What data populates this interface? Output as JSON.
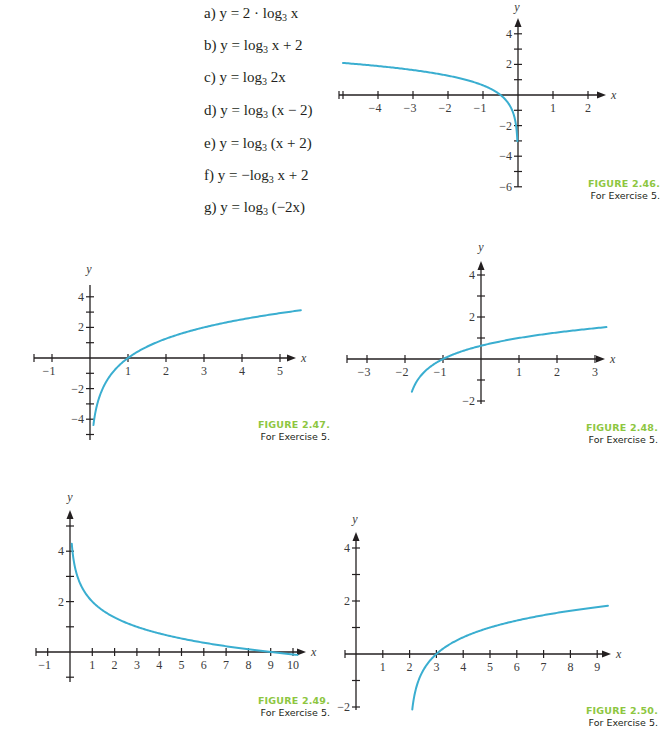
{
  "exercise": {
    "items": [
      {
        "label": "a)",
        "pre": "y = 2 · log",
        "base": "3",
        "post": " x"
      },
      {
        "label": "b)",
        "pre": "y = log",
        "base": "3",
        "post": " x + 2"
      },
      {
        "label": "c)",
        "pre": "y = log",
        "base": "3",
        "post": " 2x"
      },
      {
        "label": "d)",
        "pre": "y = log",
        "base": "3",
        "post": " (x − 2)"
      },
      {
        "label": "e)",
        "pre": "y = log",
        "base": "3",
        "post": " (x + 2)"
      },
      {
        "label": "f)",
        "pre": "y = −log",
        "base": "3",
        "post": " x + 2"
      },
      {
        "label": "g)",
        "pre": "y = log",
        "base": "3",
        "post": " (−2x)"
      }
    ]
  },
  "colors": {
    "curve": "#3aaed0",
    "axis": "#231f20",
    "caption_accent": "#8dc63f"
  },
  "chart_data": [
    {
      "id": "fig-2-46",
      "type": "line",
      "title": "FIGURE 2.46.",
      "subtitle": "For Exercise 5.",
      "xlabel": "x",
      "ylabel": "y",
      "xlim": [
        -5.1,
        2.5
      ],
      "ylim": [
        -6.3,
        5
      ],
      "x_ticks": [
        -4,
        -3,
        -2,
        -1,
        1,
        2
      ],
      "x_minor_ticks": [
        -5,
        -4,
        -3,
        -2,
        -1,
        1,
        2
      ],
      "y_ticks": [
        4,
        2,
        -2,
        -4,
        -6
      ],
      "y_minor_ticks": [
        4,
        3,
        2,
        1,
        -1,
        -2,
        -3,
        -4,
        -5,
        -6
      ],
      "grid": false,
      "function": "log3(-2x)",
      "k": -2,
      "h": 0,
      "a": 1,
      "c": 0,
      "domain": [
        -5.0,
        -0.018
      ],
      "points": [
        [
          -5,
          2.1
        ],
        [
          -3,
          1.63
        ],
        [
          -1,
          0.63
        ],
        [
          -0.5,
          0
        ],
        [
          -0.1,
          -1.46
        ],
        [
          -0.02,
          -2.93
        ]
      ],
      "layout": {
        "ox": 518,
        "oy": 95,
        "sx": 35,
        "sy": 15.3,
        "x_start": 339,
        "x_end": 606,
        "y_top": 18,
        "y_bottom": 187,
        "y_arrow": true,
        "ylabel_pos": [
          517,
          11
        ],
        "caption_pos": [
          568,
          178
        ]
      }
    },
    {
      "id": "fig-2-47",
      "type": "line",
      "title": "FIGURE 2.47.",
      "subtitle": "For Exercise 5.",
      "xlabel": "x",
      "ylabel": "y",
      "xlim": [
        -1.3,
        5.6
      ],
      "ylim": [
        -5.2,
        4.7
      ],
      "x_ticks": [
        -1,
        1,
        2,
        3,
        4,
        5
      ],
      "x_minor_ticks": [
        -1,
        1,
        2,
        3,
        4,
        5
      ],
      "y_ticks": [
        4,
        2,
        -2,
        -4
      ],
      "y_minor_ticks": [
        4,
        3,
        2,
        1,
        -1,
        -2,
        -3,
        -4,
        -5
      ],
      "grid": false,
      "function": "2*log3(x)",
      "k": 1,
      "h": 0,
      "a": 2,
      "c": 0,
      "domain": [
        0.09,
        5.55
      ],
      "points": [
        [
          0.1,
          -4.19
        ],
        [
          0.5,
          -1.26
        ],
        [
          1,
          0
        ],
        [
          2,
          1.26
        ],
        [
          3,
          2
        ],
        [
          4,
          2.52
        ],
        [
          5,
          2.93
        ]
      ],
      "layout": {
        "ox": 90,
        "oy": 358,
        "sx": 38,
        "sy": 15.3,
        "x_start": 34,
        "x_end": 296,
        "y_top": 285,
        "y_bottom": 440,
        "y_arrow": false,
        "ylabel_pos": [
          89,
          273
        ],
        "caption_pos": [
          238,
          419
        ]
      }
    },
    {
      "id": "fig-2-48",
      "type": "line",
      "title": "FIGURE 2.48.",
      "subtitle": "For Exercise 5.",
      "xlabel": "x",
      "ylabel": "y",
      "xlim": [
        -3.4,
        3.5
      ],
      "ylim": [
        -2.1,
        4.6
      ],
      "x_ticks": [
        -3,
        -2,
        -1,
        1,
        2,
        3
      ],
      "x_minor_ticks": [
        -3,
        -2,
        -1,
        1,
        2,
        3
      ],
      "y_ticks": [
        4,
        2,
        -2
      ],
      "y_minor_ticks": [
        4,
        3,
        2,
        1,
        -1,
        -2
      ],
      "grid": false,
      "function": "log3(x+2)",
      "k": 1,
      "h": -2,
      "a": 1,
      "c": 0,
      "domain": [
        -1.82,
        3.3
      ],
      "points": [
        [
          -1.8,
          -1.46
        ],
        [
          -1,
          0
        ],
        [
          0,
          0.63
        ],
        [
          1,
          1
        ],
        [
          2,
          1.26
        ],
        [
          3,
          1.46
        ]
      ],
      "layout": {
        "ox": 481,
        "oy": 359,
        "sx": 38,
        "sy": 21,
        "x_start": 347,
        "x_end": 605,
        "y_top": 261,
        "y_bottom": 404,
        "y_arrow": true,
        "ylabel_pos": [
          481,
          251
        ],
        "caption_pos": [
          566,
          422
        ]
      }
    },
    {
      "id": "fig-2-49",
      "type": "line",
      "title": "FIGURE 2.49.",
      "subtitle": "For Exercise 5.",
      "xlabel": "x",
      "ylabel": "y",
      "xlim": [
        -1.2,
        10.6
      ],
      "ylim": [
        -1.1,
        5.7
      ],
      "x_ticks": [
        -1,
        1,
        2,
        3,
        4,
        5,
        6,
        7,
        8,
        9,
        10
      ],
      "x_minor_ticks": [
        -1,
        1,
        2,
        3,
        4,
        5,
        6,
        7,
        8,
        9,
        10
      ],
      "y_ticks": [
        4,
        2
      ],
      "y_minor_ticks": [
        5,
        4,
        3,
        2,
        1,
        -1
      ],
      "grid": false,
      "function": "-log3(x)+2",
      "k": 1,
      "h": 0,
      "a": -1,
      "c": 2,
      "domain": [
        0.08,
        10.2
      ],
      "points": [
        [
          0.1,
          4.1
        ],
        [
          1,
          2
        ],
        [
          3,
          1
        ],
        [
          5,
          0.54
        ],
        [
          9,
          0
        ],
        [
          10,
          -0.1
        ]
      ],
      "layout": {
        "ox": 70,
        "oy": 652,
        "sx": 22.3,
        "sy": 25.2,
        "x_start": 36,
        "x_end": 306,
        "y_top": 510,
        "y_bottom": 682,
        "y_arrow": true,
        "ylabel_pos": [
          70,
          501
        ],
        "caption_pos": [
          238,
          695
        ]
      }
    },
    {
      "id": "fig-2-50",
      "type": "line",
      "title": "FIGURE 2.50.",
      "subtitle": "For Exercise 5.",
      "xlabel": "x",
      "ylabel": "y",
      "xlim": [
        -0.3,
        9.5
      ],
      "ylim": [
        -2.1,
        4.7
      ],
      "x_ticks": [
        1,
        2,
        3,
        4,
        5,
        6,
        7,
        8,
        9
      ],
      "x_minor_ticks": [
        1,
        2,
        3,
        4,
        5,
        6,
        7,
        8,
        9
      ],
      "y_ticks": [
        4,
        2,
        -2
      ],
      "y_minor_ticks": [
        4,
        3,
        2,
        1,
        -1,
        -2
      ],
      "grid": false,
      "function": "log3(x-2)",
      "k": 1,
      "h": 2,
      "a": 1,
      "c": 0,
      "domain": [
        2.1,
        9.4
      ],
      "points": [
        [
          2.1,
          -2.1
        ],
        [
          3,
          0
        ],
        [
          4,
          0.63
        ],
        [
          5,
          1
        ],
        [
          6,
          1.26
        ],
        [
          8,
          1.63
        ],
        [
          9,
          1.77
        ]
      ],
      "layout": {
        "ox": 356,
        "oy": 654,
        "sx": 26.8,
        "sy": 26.5,
        "x_start": 345,
        "x_end": 611,
        "y_top": 532,
        "y_bottom": 710,
        "y_arrow": true,
        "ylabel_pos": [
          355,
          523
        ],
        "caption_pos": [
          566,
          705
        ]
      }
    }
  ]
}
